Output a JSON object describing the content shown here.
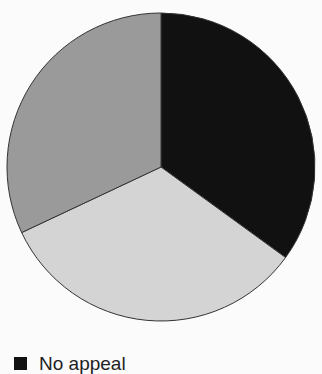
{
  "chart_data": {
    "type": "pie",
    "title": "",
    "start_angle_deg": 0,
    "direction": "clockwise",
    "slices": [
      {
        "label": "No appeal",
        "value": 35,
        "color": "#111111"
      },
      {
        "label": "",
        "value": 33,
        "color": "#d4d4d4"
      },
      {
        "label": "",
        "value": 32,
        "color": "#9a9a9a"
      }
    ],
    "legend": {
      "position": "bottom-left",
      "entries": [
        "No appeal"
      ]
    }
  },
  "legend": {
    "items": [
      {
        "label": "No appeal",
        "color": "#111111"
      }
    ]
  }
}
